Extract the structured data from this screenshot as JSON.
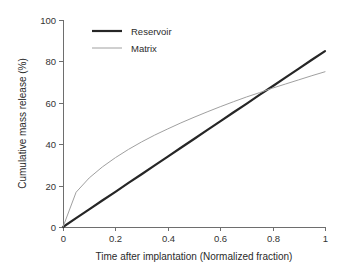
{
  "chart_data": {
    "type": "line",
    "title": "",
    "xlabel": "Time after implantation (Normalized fraction)",
    "ylabel": "Cumulative mass release (%)",
    "xlim": [
      0,
      1
    ],
    "ylim": [
      0,
      100
    ],
    "grid": false,
    "legend_position": "top-left-inside",
    "x_ticks": [
      "0",
      "0.2",
      "0.4",
      "0.6",
      "0.8",
      "1"
    ],
    "x_tick_values": [
      0,
      0.2,
      0.4,
      0.6,
      0.8,
      1
    ],
    "y_ticks": [
      "0",
      "20",
      "40",
      "60",
      "80",
      "100"
    ],
    "y_tick_values": [
      0,
      20,
      40,
      60,
      80,
      100
    ],
    "x": [
      0,
      0.05,
      0.1,
      0.15,
      0.2,
      0.25,
      0.3,
      0.35,
      0.4,
      0.45,
      0.5,
      0.55,
      0.6,
      0.65,
      0.7,
      0.75,
      0.8,
      0.85,
      0.9,
      0.95,
      1
    ],
    "series": [
      {
        "name": "Reservoir",
        "color": "#262626",
        "width": 2.2,
        "values": [
          0,
          4.3,
          8.5,
          12.8,
          17.0,
          21.3,
          25.5,
          29.8,
          34.0,
          38.3,
          42.5,
          46.8,
          51.0,
          55.3,
          59.5,
          63.8,
          68.0,
          72.3,
          76.5,
          80.8,
          85.0
        ]
      },
      {
        "name": "Matrix",
        "color": "#a0a0a0",
        "width": 1.0,
        "values": [
          0,
          16.8,
          23.7,
          29.0,
          33.5,
          37.5,
          41.1,
          44.4,
          47.4,
          50.3,
          53.0,
          55.6,
          58.1,
          60.5,
          62.8,
          64.9,
          67.1,
          69.1,
          71.1,
          73.1,
          75.0
        ]
      }
    ],
    "legend": [
      {
        "label": "Reservoir",
        "color": "#262626",
        "width": 2.2
      },
      {
        "label": "Matrix",
        "color": "#a0a0a0",
        "width": 1.0
      }
    ],
    "annotations": []
  }
}
